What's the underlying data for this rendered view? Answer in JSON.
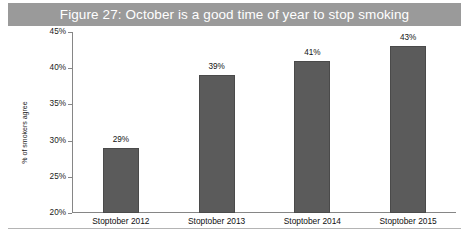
{
  "figure": {
    "title": "Figure 27: October is a good time of year to stop smoking",
    "title_band_color": "#9a9a9a",
    "title_text_color": "#ffffff",
    "bottom_rule_color": "#b4b4b4"
  },
  "chart_data": {
    "type": "bar",
    "title": "Figure 27: October is a good time of year to stop smoking",
    "categories": [
      "Stoptober 2012",
      "Stoptober 2013",
      "Stoptober 2014",
      "Stoptober 2015"
    ],
    "values": [
      29,
      39,
      41,
      43
    ],
    "data_labels": [
      "29%",
      "39%",
      "41%",
      "43%"
    ],
    "xlabel": "",
    "ylabel": "% of smokers agree",
    "ylim": [
      20,
      45
    ],
    "ytick_values": [
      45,
      40,
      35,
      30,
      25,
      20
    ],
    "ytick_labels": [
      "45%",
      "40%",
      "35%",
      "30%",
      "25%",
      "20%"
    ],
    "grid": false,
    "legend": false,
    "bar_color": "#5b5b5b",
    "bar_edge_color": "#4a4a4a",
    "axis_color": "#868686"
  }
}
